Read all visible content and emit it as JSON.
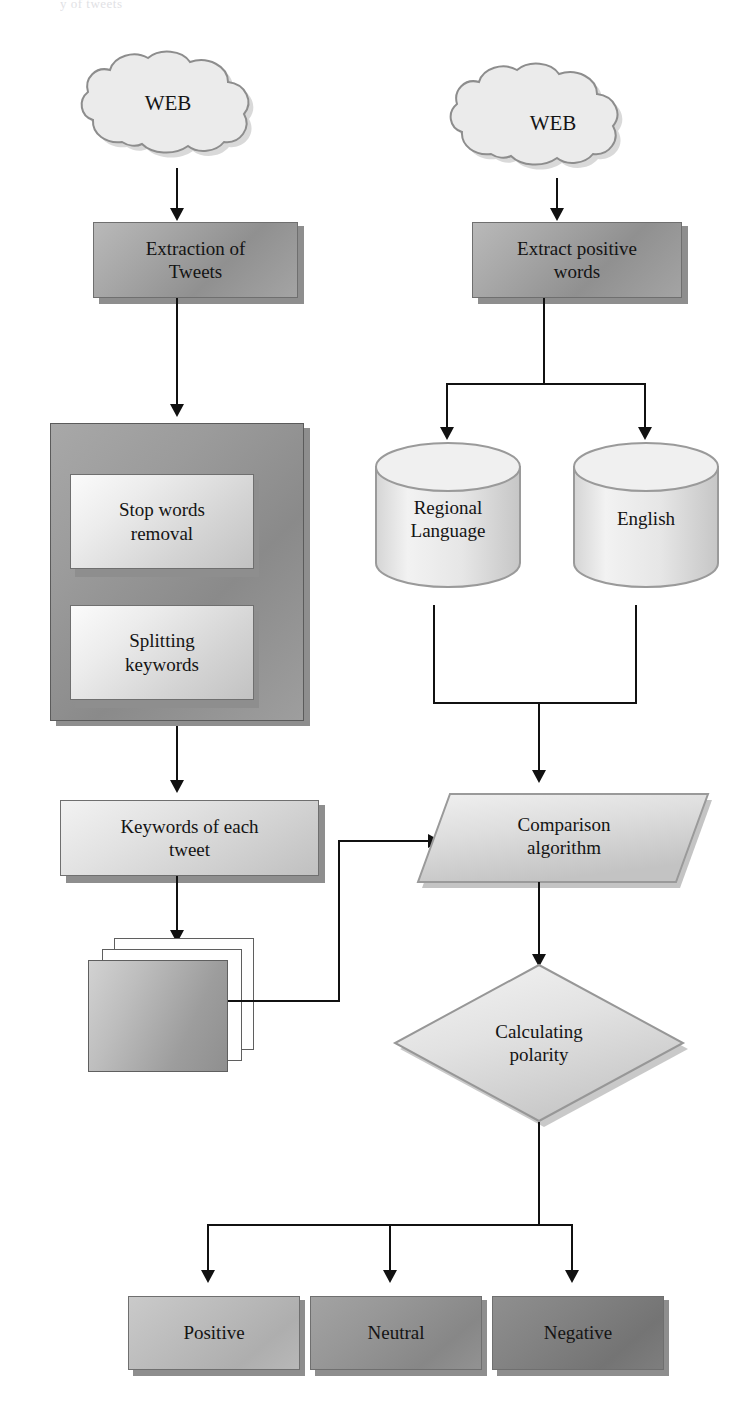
{
  "diagram": {
    "title_stub": "y of tweets",
    "nodes": {
      "web_left": {
        "label": "WEB",
        "shape": "cloud"
      },
      "web_right": {
        "label": "WEB",
        "shape": "cloud"
      },
      "extraction_of_tweets": {
        "label": "Extraction of\nTweets",
        "shape": "rectangle"
      },
      "extract_positive_words": {
        "label": "Extract positive\nwords",
        "shape": "rectangle"
      },
      "preprocessing_panel": {
        "label": "",
        "shape": "container"
      },
      "stop_words_removal": {
        "label": "Stop words\nremoval",
        "shape": "rectangle"
      },
      "splitting_keywords": {
        "label": "Splitting\nkeywords",
        "shape": "rectangle"
      },
      "regional_language_db": {
        "label": "Regional\nLanguage",
        "shape": "cylinder"
      },
      "english_db": {
        "label": "English",
        "shape": "cylinder"
      },
      "keywords_of_each_tweet": {
        "label": "Keywords of each\ntweet",
        "shape": "rectangle"
      },
      "tweet_documents": {
        "label": "",
        "shape": "stacked-documents"
      },
      "comparison_algorithm": {
        "label": "Comparison\nalgorithm",
        "shape": "parallelogram"
      },
      "calculating_polarity": {
        "label": "Calculating\npolarity",
        "shape": "diamond"
      },
      "positive": {
        "label": "Positive",
        "shape": "rectangle"
      },
      "neutral": {
        "label": "Neutral",
        "shape": "rectangle"
      },
      "negative": {
        "label": "Negative",
        "shape": "rectangle"
      }
    },
    "colors": {
      "line": "#111111",
      "box_border": "#6f6f6f",
      "panel_fill": "#9b9b9b",
      "positive_fill": "#b4b4b4",
      "neutral_fill": "#909090",
      "negative_fill": "#7d7d7d",
      "background": "#ffffff"
    }
  }
}
